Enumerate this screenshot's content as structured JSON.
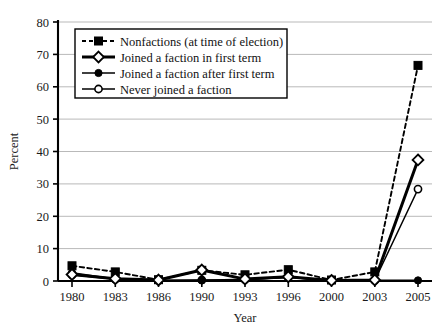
{
  "chart_data": {
    "type": "line",
    "title": "",
    "xlabel": "Year",
    "ylabel": "Percent",
    "categories": [
      "1980",
      "1983",
      "1986",
      "1990",
      "1993",
      "1996",
      "2000",
      "2003",
      "2005"
    ],
    "ylim": [
      0,
      80
    ],
    "yticks": [
      0,
      10,
      20,
      30,
      40,
      50,
      60,
      70,
      80
    ],
    "ytick_labels": [
      "0",
      "10",
      "20",
      "30",
      "40",
      "50",
      "60",
      "70",
      "80"
    ],
    "grid": "horizontal",
    "legend_position": "upper-left-inside",
    "series": [
      {
        "name": "Nonfactions (at time of election)",
        "marker": "filled-square",
        "line_style": "dashed",
        "color": "#000000",
        "values": [
          4.7,
          2.8,
          0.4,
          3.3,
          1.9,
          3.5,
          0.3,
          2.8,
          66.6
        ]
      },
      {
        "name": "Joined a faction in first term",
        "marker": "open-diamond",
        "line_style": "solid-thick",
        "color": "#000000",
        "values": [
          2.0,
          0.7,
          0.3,
          3.4,
          0.6,
          1.3,
          0.2,
          0.3,
          37.4
        ]
      },
      {
        "name": "Joined a faction after first term",
        "marker": "filled-circle",
        "line_style": "solid",
        "color": "#000000",
        "values": [
          2.5,
          0.6,
          0.2,
          0.2,
          0.5,
          1.2,
          0.1,
          0.2,
          0.2
        ]
      },
      {
        "name": "Never joined a faction",
        "marker": "open-circle",
        "line_style": "solid-thin",
        "color": "#000000",
        "values": [
          1.9,
          0.5,
          0.2,
          0.3,
          0.4,
          1.1,
          0.1,
          0.2,
          28.4
        ]
      }
    ]
  }
}
